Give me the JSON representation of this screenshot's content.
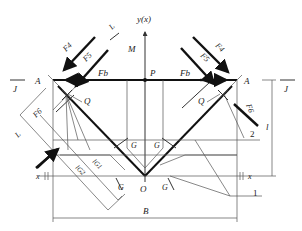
{
  "diagram": {
    "axis_label_y": "y(x)",
    "labels": {
      "M": "M",
      "P": "P",
      "A_left": "A",
      "A_right": "A",
      "J_left": "J",
      "J_right": "J",
      "L_top": "L",
      "L_left": "L",
      "Q_left": "Q",
      "Q_right": "Q",
      "O": "O",
      "B": "B",
      "l": "l",
      "x_left": "x",
      "x_right": "x",
      "one": "1",
      "two": "2",
      "G1": "G",
      "G2": "G",
      "G3": "G",
      "G4": "G",
      "lG2": "lG2",
      "lG1": "lG1"
    },
    "forces": {
      "F4_left": "F4",
      "F5_left": "F5",
      "Fb_left": "Fb",
      "F6_left": "F6",
      "F4_right": "F4",
      "F5_right": "F5",
      "Fb_right": "Fb",
      "F6_right": "F6"
    },
    "colors": {
      "line": "#333333",
      "thick": "#111111",
      "background": "#ffffff"
    }
  }
}
